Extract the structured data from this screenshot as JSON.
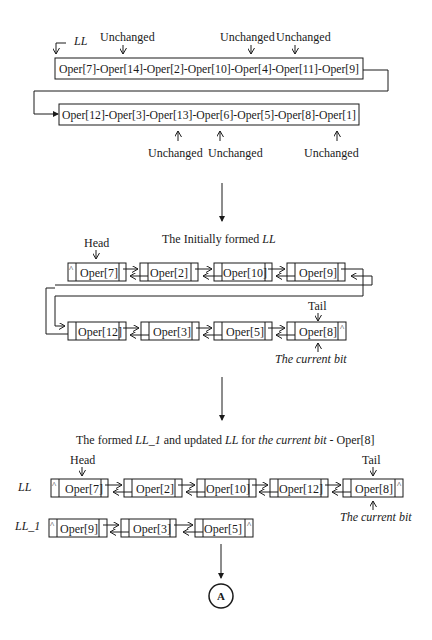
{
  "stage1": {
    "ll_label": "LL",
    "row1": "Oper[7]-Oper[14]-Oper[2]-Oper[10]-Oper[4]-Oper[11]-Oper[9]",
    "row2": "Oper[12]-Oper[3]-Oper[13]-Oper[6]-Oper[5]-Oper[8]-Oper[1]",
    "unchanged_top": [
      "Unchanged",
      "Unchanged",
      "Unchanged"
    ],
    "unchanged_bottom": [
      "Unchanged",
      "Unchanged",
      "Unchanged"
    ]
  },
  "stage2": {
    "title_prefix": "The Initially formed ",
    "title_ll": "LL",
    "head_label": "Head",
    "tail_label": "Tail",
    "current_bit_label": "The current bit",
    "row1_nodes": [
      "Oper[7]",
      "Oper[2]",
      "Oper[10]",
      "Oper[9]"
    ],
    "row2_nodes": [
      "Oper[12]",
      "Oper[3]",
      "Oper[5]",
      "Oper[8]"
    ],
    "null_marker": "^"
  },
  "stage3": {
    "title_a": "The formed ",
    "title_ll1": "LL_1",
    "title_b": " and updated ",
    "title_ll": "LL",
    "title_c": " for ",
    "title_cb": "the current bit",
    "title_d": " - Oper[8]",
    "head_label": "Head",
    "tail_label": "Tail",
    "ll_row_label": "LL",
    "ll1_row_label": "LL_1",
    "current_bit_label": "The current bit",
    "ll_nodes": [
      "Oper[7]",
      "Oper[2]",
      "Oper[10]",
      "Oper[12]",
      "Oper[8]"
    ],
    "ll1_nodes": [
      "Oper[9]",
      "Oper[3]",
      "Oper[5]"
    ],
    "null_marker": "^"
  },
  "connector": {
    "label": "A"
  }
}
